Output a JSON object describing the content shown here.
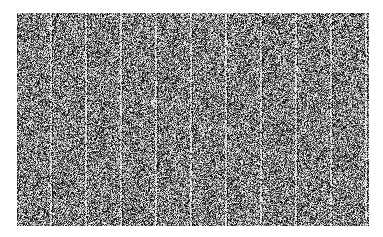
{
  "image": {
    "description": "grayscale noise texture with periodic vertical bright streaks",
    "background_color": "#ffffff",
    "texture_base_color": "#6e6e6e",
    "region": {
      "x": 17,
      "y": 13,
      "width": 352,
      "height": 213
    },
    "streak_spacing_px": 35,
    "streak_count": 10
  }
}
